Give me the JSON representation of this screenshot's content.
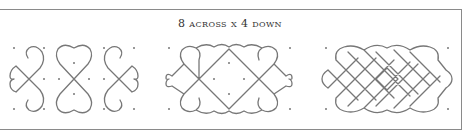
{
  "figure": {
    "title": "8 across x 4 down",
    "line_color": "#777777",
    "frame_color": "#8a8a8a",
    "panels": [
      {
        "name": "component-motifs",
        "description": "three separate motifs: left loop cross, center double heart, right loop cross"
      },
      {
        "name": "partially-woven",
        "description": "motifs joined into a woven band with center diamond"
      },
      {
        "name": "fully-woven",
        "description": "complete 8 across x 4 down kolam lattice"
      }
    ]
  }
}
